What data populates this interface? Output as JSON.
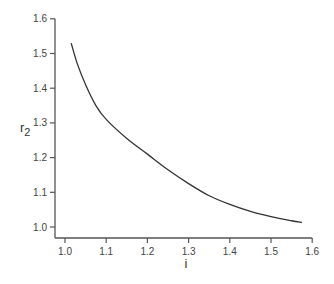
{
  "chart_data": {
    "type": "line",
    "title": "",
    "xlabel": "i",
    "ylabel": "r",
    "ylabel_subscript": "2",
    "xlim": [
      0.975,
      1.6
    ],
    "ylim": [
      0.97,
      1.6
    ],
    "xticks": [
      "1.0",
      "1.1",
      "1.2",
      "1.3",
      "1.4",
      "1.5",
      "1.6"
    ],
    "yticks": [
      "1.0",
      "1.1",
      "1.2",
      "1.3",
      "1.4",
      "1.5",
      "1.6"
    ],
    "grid": false,
    "legend": null,
    "series": [
      {
        "name": "r2(i)",
        "color": "#333333",
        "x": [
          1.015,
          1.03,
          1.05,
          1.075,
          1.1,
          1.15,
          1.2,
          1.25,
          1.3,
          1.35,
          1.4,
          1.45,
          1.5,
          1.55,
          1.575
        ],
        "y": [
          1.53,
          1.47,
          1.41,
          1.35,
          1.31,
          1.255,
          1.21,
          1.165,
          1.125,
          1.09,
          1.065,
          1.045,
          1.03,
          1.018,
          1.013
        ]
      }
    ]
  }
}
